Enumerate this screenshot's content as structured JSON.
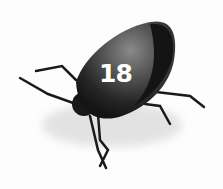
{
  "image": {
    "subject": "stink bug",
    "label_number": "18",
    "background_color": "#fdfdfd",
    "body_color": "#1c1c1c",
    "shell_highlight_color": "#6e6e6e"
  }
}
